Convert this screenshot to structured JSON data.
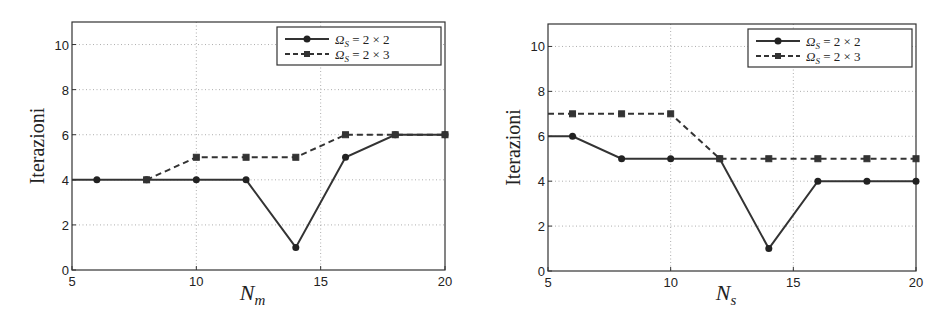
{
  "chart_data": [
    {
      "type": "line",
      "title": "",
      "xlabel": "N_m",
      "xlabel_main": "N",
      "xlabel_sub": "m",
      "ylabel": "Iterazioni",
      "xlim": [
        5,
        20
      ],
      "ylim": [
        0,
        11
      ],
      "xticks": [
        5,
        10,
        15,
        20
      ],
      "yticks": [
        0,
        2,
        4,
        6,
        8,
        10
      ],
      "grid": true,
      "legend_position": "upper right",
      "series": [
        {
          "name": "Ωs = 2 × 2",
          "style": "solid",
          "marker": "circle",
          "x": [
            5,
            6,
            8,
            10,
            12,
            14,
            16,
            18,
            20
          ],
          "values": [
            4,
            4,
            4,
            4,
            4,
            1,
            5,
            6,
            6
          ]
        },
        {
          "name": "Ωs = 2 × 3",
          "style": "dashed",
          "marker": "square",
          "x": [
            8,
            10,
            12,
            14,
            16,
            18,
            20
          ],
          "values": [
            4,
            5,
            5,
            5,
            6,
            6,
            6
          ]
        }
      ]
    },
    {
      "type": "line",
      "title": "",
      "xlabel": "N_s",
      "xlabel_main": "N",
      "xlabel_sub": "s",
      "ylabel": "Iterazioni",
      "xlim": [
        5,
        20
      ],
      "ylim": [
        0,
        11
      ],
      "xticks": [
        5,
        10,
        15,
        20
      ],
      "yticks": [
        0,
        2,
        4,
        6,
        8,
        10
      ],
      "grid": true,
      "legend_position": "upper right",
      "series": [
        {
          "name": "Ωs = 2 × 2",
          "style": "solid",
          "marker": "circle",
          "x": [
            5,
            6,
            8,
            10,
            12,
            14,
            16,
            18,
            20
          ],
          "values": [
            6,
            6,
            5,
            5,
            5,
            1,
            4,
            4,
            4
          ]
        },
        {
          "name": "Ωs = 2 × 3",
          "style": "dashed",
          "marker": "square",
          "x": [
            5,
            6,
            8,
            10,
            12,
            14,
            16,
            18,
            20
          ],
          "values": [
            7,
            7,
            7,
            7,
            5,
            5,
            5,
            5,
            5
          ]
        }
      ]
    }
  ],
  "legend": {
    "omega_symbol": "Ω",
    "subscript": "S",
    "series1_rhs": "= 2 × 2",
    "series2_rhs": "= 2 × 3"
  }
}
